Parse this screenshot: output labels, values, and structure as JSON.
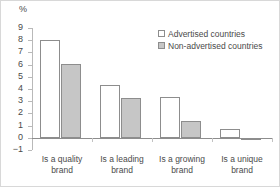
{
  "chart_data": {
    "type": "bar",
    "title": "",
    "subtitle": "",
    "xlabel": "",
    "ylabel": "%",
    "unit_label": "%",
    "categories": [
      "Is a quality\nbrand",
      "Is a leading\nbrand",
      "Is a growing\nbrand",
      "Is a unique\nbrand"
    ],
    "series": [
      {
        "name": "Advertised countries",
        "values": [
          8.05,
          4.3,
          3.35,
          0.7
        ],
        "fill": "#ffffff",
        "stroke": "#8d8d8d"
      },
      {
        "name": "Non-advertised countries",
        "values": [
          6.05,
          3.25,
          1.4,
          -0.15
        ],
        "fill": "#c6c6c6",
        "stroke": "#8d8d8d"
      }
    ],
    "ylim": [
      -1,
      9
    ],
    "yticks": [
      9,
      8,
      7,
      6,
      5,
      4,
      3,
      2,
      1,
      0,
      -1
    ],
    "ytick_labels": [
      "9",
      "8",
      "7",
      "6",
      "5",
      "4",
      "3",
      "2",
      "1",
      "0",
      "−1"
    ],
    "grid": false,
    "legend_position": "top-right",
    "zero_line": 0
  },
  "legend": {
    "entries": [
      {
        "label": "Advertised countries",
        "swatch": "advertised"
      },
      {
        "label": "Non-advertised countries",
        "swatch": "nonadvertised"
      }
    ]
  },
  "colors": {
    "advertised_fill": "#ffffff",
    "nonadvertised_fill": "#c6c6c6",
    "bar_stroke": "#8d8d8d",
    "axis": "#b9b9b9",
    "text": "#4a4a4a",
    "border": "#d8d8d8",
    "background": "#ffffff"
  }
}
